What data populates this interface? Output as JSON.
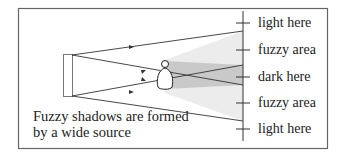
{
  "diagram": {
    "caption_line1": "Fuzzy shadows are formed",
    "caption_line2": "by a wide source",
    "labels": [
      "light here",
      "fuzzy area",
      "dark here",
      "fuzzy area",
      "light here"
    ],
    "colors": {
      "frame": "#555555",
      "line": "#333333",
      "fuzzy": "#ebebeb",
      "dark": "#c8c8c8"
    }
  }
}
